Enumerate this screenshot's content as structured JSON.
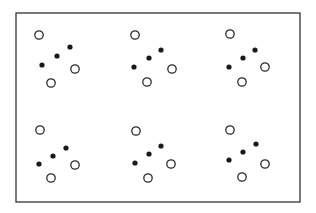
{
  "figure": {
    "frame": {
      "x": 16,
      "y": 13,
      "width": 284,
      "height": 189,
      "stroke": "#333333",
      "stroke_width": 1.3
    },
    "dot_styles": {
      "open": {
        "radius": 4.2,
        "fill": "#ffffff",
        "stroke": "#2a2a2a",
        "stroke_width": 1.3
      },
      "filled": {
        "radius": 2.6,
        "fill": "#1a1a1a"
      }
    },
    "clusters": [
      {
        "id": "top-left",
        "open": [
          [
            39,
            35
          ],
          [
            75,
            69
          ],
          [
            51,
            83
          ]
        ],
        "filled": [
          [
            70,
            47
          ],
          [
            57,
            56
          ],
          [
            42,
            65
          ]
        ]
      },
      {
        "id": "top-middle",
        "open": [
          [
            135,
            35
          ],
          [
            172,
            69
          ],
          [
            147,
            82
          ]
        ],
        "filled": [
          [
            161,
            50
          ],
          [
            149,
            58
          ],
          [
            134,
            67
          ]
        ]
      },
      {
        "id": "top-right",
        "open": [
          [
            230,
            34
          ],
          [
            265,
            67
          ],
          [
            242,
            82
          ]
        ],
        "filled": [
          [
            255,
            50
          ],
          [
            243,
            58
          ],
          [
            229,
            67
          ]
        ]
      },
      {
        "id": "bottom-left",
        "open": [
          [
            40,
            130
          ],
          [
            75,
            165
          ],
          [
            51,
            178
          ]
        ],
        "filled": [
          [
            66,
            148
          ],
          [
            53,
            156
          ],
          [
            39,
            164
          ]
        ]
      },
      {
        "id": "bottom-middle",
        "open": [
          [
            136,
            131
          ],
          [
            171,
            164
          ],
          [
            148,
            178
          ]
        ],
        "filled": [
          [
            161,
            146
          ],
          [
            149,
            154
          ],
          [
            135,
            163
          ]
        ]
      },
      {
        "id": "bottom-right",
        "open": [
          [
            230,
            130
          ],
          [
            265,
            164
          ],
          [
            242,
            177
          ]
        ],
        "filled": [
          [
            256,
            144
          ],
          [
            243,
            152
          ],
          [
            229,
            160
          ]
        ]
      }
    ]
  }
}
